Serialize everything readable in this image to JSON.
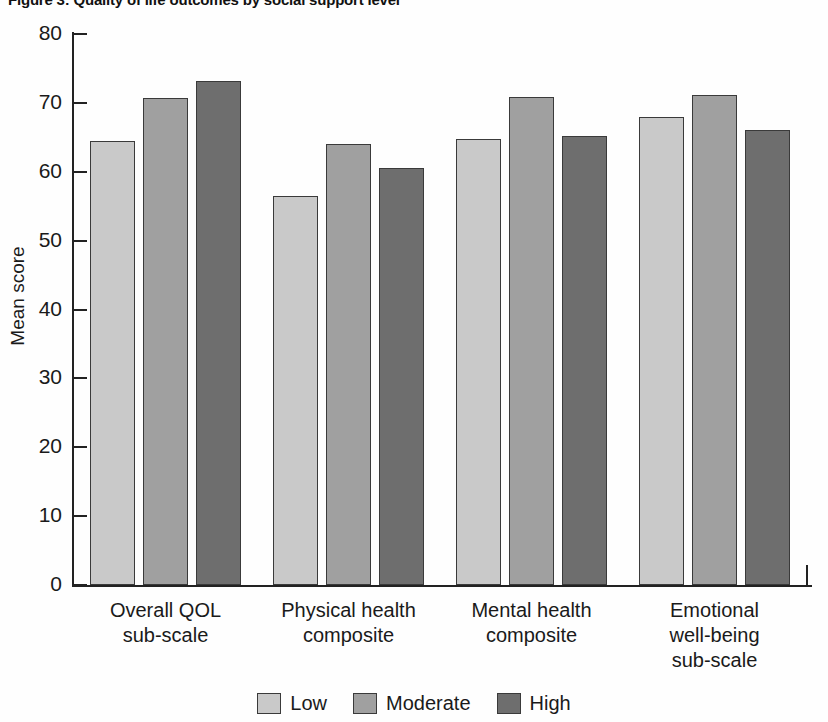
{
  "figure": {
    "title": "Figure 3: Quality of life outcomes by social support level"
  },
  "chart_data": {
    "type": "bar",
    "title": "",
    "xlabel": "",
    "ylabel": "Mean score",
    "ylim": [
      0,
      80
    ],
    "yticks": [
      0,
      10,
      20,
      30,
      40,
      50,
      60,
      70,
      80
    ],
    "ytick_labels": [
      "0",
      "10",
      "20",
      "30",
      "40",
      "50",
      "60",
      "70",
      "80"
    ],
    "grid": false,
    "legend_position": "bottom-center",
    "categories": [
      "Overall QOL\nsub-scale",
      "Physical health\ncomposite",
      "Mental health\ncomposite",
      "Emotional\nwell-being\nsub-scale"
    ],
    "category_lines": [
      [
        "Overall QOL",
        "sub-scale"
      ],
      [
        "Physical health",
        "composite"
      ],
      [
        "Mental health",
        "composite"
      ],
      [
        "Emotional",
        "well-being",
        "sub-scale"
      ]
    ],
    "series": [
      {
        "name": "Low",
        "color": "#c9c9c9",
        "values": [
          64.5,
          56.5,
          64.7,
          67.9
        ]
      },
      {
        "name": "Moderate",
        "color": "#a0a0a0",
        "values": [
          70.7,
          64.0,
          70.8,
          71.2
        ]
      },
      {
        "name": "High",
        "color": "#6e6e6e",
        "values": [
          73.2,
          60.6,
          65.2,
          66.0
        ]
      }
    ]
  },
  "legend": {
    "items": [
      {
        "label": "Low",
        "swatch": "low"
      },
      {
        "label": "Moderate",
        "swatch": "moderate"
      },
      {
        "label": "High",
        "swatch": "high"
      }
    ]
  }
}
